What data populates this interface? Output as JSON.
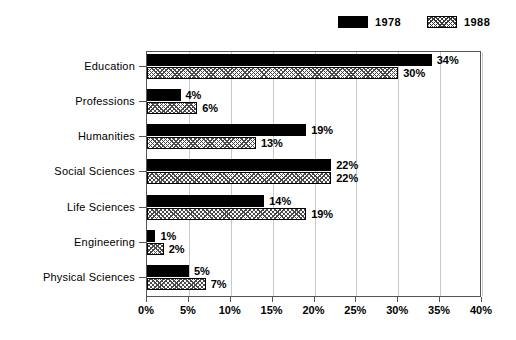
{
  "chart_data": {
    "type": "bar",
    "orientation": "horizontal",
    "title": "",
    "xlabel": "",
    "ylabel": "",
    "xlim": [
      0,
      40
    ],
    "xtick_labels": [
      "0%",
      "5%",
      "10%",
      "15%",
      "20%",
      "25%",
      "30%",
      "35%",
      "40%"
    ],
    "xtick_values": [
      0,
      5,
      10,
      15,
      20,
      25,
      30,
      35,
      40
    ],
    "grid": true,
    "legend_position": "top-right",
    "categories": [
      "Education",
      "Professions",
      "Humanities",
      "Social Sciences",
      "Life Sciences",
      "Engineering",
      "Physical Sciences"
    ],
    "series": [
      {
        "name": "1978",
        "color": "#000000",
        "fill": "solid-black",
        "values": [
          34,
          4,
          19,
          22,
          14,
          1,
          5
        ],
        "labels": [
          "34%",
          "4%",
          "19%",
          "22%",
          "14%",
          "1%",
          "5%"
        ]
      },
      {
        "name": "1988",
        "color": "#ffffff",
        "fill": "cross-hatch",
        "values": [
          30,
          6,
          13,
          22,
          19,
          2,
          7
        ],
        "labels": [
          "30%",
          "6%",
          "13%",
          "22%",
          "19%",
          "2%",
          "7%"
        ]
      }
    ]
  },
  "legend": {
    "items": [
      {
        "label": "1978",
        "swatch": "solid-black-swatch"
      },
      {
        "label": "1988",
        "swatch": "cross-hatch-swatch"
      }
    ]
  }
}
